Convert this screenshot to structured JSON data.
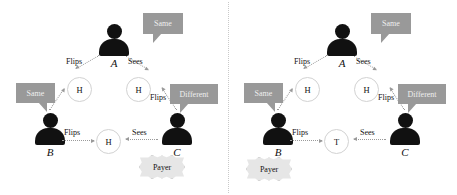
{
  "figure": {
    "type": "diagram",
    "panels": [
      {
        "id": "left",
        "parties": [
          {
            "id": "A",
            "label": "A",
            "role": "top"
          },
          {
            "id": "B",
            "label": "B",
            "role": "bottom-left"
          },
          {
            "id": "C",
            "label": "C",
            "role": "bottom-right"
          }
        ],
        "coins": [
          {
            "id": "ab",
            "face": "H",
            "edge": "A-B"
          },
          {
            "id": "ac",
            "face": "H",
            "edge": "A-C"
          },
          {
            "id": "bc",
            "face": "H",
            "edge": "B-C"
          }
        ],
        "edges": [
          {
            "from": "A",
            "to": "ab",
            "label": "Flips"
          },
          {
            "from": "B",
            "to": "ab",
            "label": "Sees"
          },
          {
            "from": "A",
            "to": "ac",
            "label": "Sees"
          },
          {
            "from": "C",
            "to": "ac",
            "label": "Flips"
          },
          {
            "from": "B",
            "to": "bc",
            "label": "Flips"
          },
          {
            "from": "C",
            "to": "bc",
            "label": "Sees"
          }
        ],
        "bubbles": [
          {
            "owner": "A",
            "text": "Same"
          },
          {
            "owner": "B",
            "text": "Same"
          },
          {
            "owner": "C",
            "text": "Different"
          }
        ],
        "payer": {
          "label": "Payer",
          "party": "C"
        }
      },
      {
        "id": "right",
        "parties": [
          {
            "id": "A",
            "label": "A",
            "role": "top"
          },
          {
            "id": "B",
            "label": "B",
            "role": "bottom-left"
          },
          {
            "id": "C",
            "label": "C",
            "role": "bottom-right"
          }
        ],
        "coins": [
          {
            "id": "ab",
            "face": "H",
            "edge": "A-B"
          },
          {
            "id": "ac",
            "face": "H",
            "edge": "A-C"
          },
          {
            "id": "bc",
            "face": "T",
            "edge": "B-C"
          }
        ],
        "edges": [
          {
            "from": "A",
            "to": "ab",
            "label": "Flips"
          },
          {
            "from": "B",
            "to": "ab",
            "label": "Sees"
          },
          {
            "from": "A",
            "to": "ac",
            "label": "Sees"
          },
          {
            "from": "C",
            "to": "ac",
            "label": "Flips"
          },
          {
            "from": "B",
            "to": "bc",
            "label": "Flips"
          },
          {
            "from": "C",
            "to": "bc",
            "label": "Sees"
          }
        ],
        "bubbles": [
          {
            "owner": "A",
            "text": "Same"
          },
          {
            "owner": "B",
            "text": "Same"
          },
          {
            "owner": "C",
            "text": "Different"
          }
        ],
        "payer": {
          "label": "Payer",
          "party": "B"
        }
      }
    ],
    "colors": {
      "silhouette": "#111111",
      "bubble_fill": "#999999",
      "bubble_text": "#efefef",
      "coin_stroke": "#d2d2d2",
      "arrow": "#9a9a9a",
      "payer_fill": "#e6e6e6",
      "divider": "#c9c9c9",
      "background": "#ffffff"
    }
  }
}
